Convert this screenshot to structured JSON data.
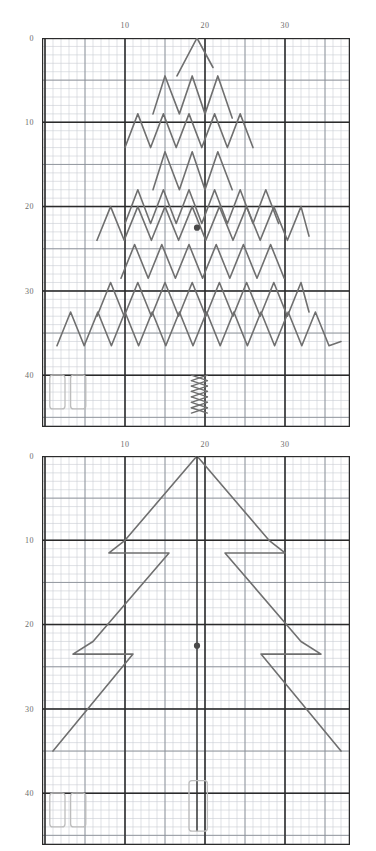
{
  "page": {
    "background_color": "#ffffff",
    "ink_color": "#6f6f6f",
    "grid_minor_color": "#c9cdd4",
    "grid_major_color": "#2b2b2b",
    "marker_color": "#4a4a4a",
    "box_color": "#bdbdbd"
  },
  "charts": [
    {
      "id": "chart-top",
      "name": "chevron-zigzag-chart",
      "axis": {
        "x_ticks": [
          "10",
          "20",
          "30"
        ],
        "x_tick_values": [
          10,
          20,
          30
        ],
        "y_ticks": [
          "0",
          "10",
          "20",
          "30",
          "40"
        ],
        "y_tick_values": [
          0,
          10,
          20,
          30,
          40
        ],
        "xlim": [
          0,
          38
        ],
        "ylim": [
          0,
          45
        ],
        "grid": true,
        "minor_step": 1,
        "major_step": 10
      },
      "marker": {
        "x": 19.0,
        "y": 22.5,
        "label": "center-point"
      }
    },
    {
      "id": "chart-bottom",
      "name": "large-chevron-chart",
      "axis": {
        "x_ticks": [
          "10",
          "20",
          "30"
        ],
        "x_tick_values": [
          10,
          20,
          30
        ],
        "y_ticks": [
          "0",
          "10",
          "20",
          "30",
          "40"
        ],
        "y_tick_values": [
          0,
          10,
          20,
          30,
          40
        ],
        "xlim": [
          0,
          38
        ],
        "ylim": [
          0,
          45
        ],
        "grid": true,
        "minor_step": 1,
        "major_step": 10
      },
      "marker": {
        "x": 19.0,
        "y": 22.5,
        "label": "center-point"
      }
    }
  ],
  "chart_data": [
    {
      "type": "line",
      "title": "Nested chevron zigzag rows (top panel)",
      "xlabel": "",
      "ylabel": "",
      "xlim": [
        0,
        38
      ],
      "ylim": [
        0,
        45
      ],
      "grid": true,
      "legend": "none",
      "x_tick_labels": [
        "10",
        "20",
        "30"
      ],
      "y_tick_labels": [
        "0",
        "10",
        "20",
        "30",
        "40"
      ],
      "series": [
        {
          "name": "row-1-peak",
          "points": [
            [
              16.5,
              4.5
            ],
            [
              19.0,
              0.0
            ],
            [
              21.0,
              3.5
            ]
          ]
        },
        {
          "name": "row-2",
          "points": [
            [
              13.5,
              9.0
            ],
            [
              15.0,
              4.5
            ],
            [
              16.8,
              9.0
            ],
            [
              18.4,
              4.5
            ],
            [
              20.0,
              9.0
            ],
            [
              21.6,
              4.5
            ],
            [
              23.4,
              9.5
            ]
          ]
        },
        {
          "name": "row-3",
          "points": [
            [
              10.0,
              13.0
            ],
            [
              11.6,
              9.0
            ],
            [
              13.2,
              13.0
            ],
            [
              14.8,
              9.0
            ],
            [
              16.4,
              13.0
            ],
            [
              18.0,
              9.0
            ],
            [
              19.6,
              13.0
            ],
            [
              21.2,
              9.0
            ],
            [
              22.8,
              13.0
            ],
            [
              24.4,
              9.0
            ],
            [
              26.0,
              13.0
            ]
          ]
        },
        {
          "name": "row-4",
          "points": [
            [
              13.5,
              18.0
            ],
            [
              15.0,
              13.5
            ],
            [
              16.8,
              18.0
            ],
            [
              18.4,
              13.5
            ],
            [
              20.0,
              18.0
            ],
            [
              21.6,
              13.5
            ],
            [
              23.4,
              18.0
            ]
          ]
        },
        {
          "name": "row-5",
          "points": [
            [
              10.0,
              22.0
            ],
            [
              11.6,
              18.0
            ],
            [
              13.2,
              22.0
            ],
            [
              14.8,
              18.0
            ],
            [
              16.4,
              22.0
            ],
            [
              18.0,
              18.0
            ],
            [
              19.6,
              22.0
            ],
            [
              21.2,
              18.0
            ],
            [
              22.8,
              22.0
            ],
            [
              24.4,
              18.0
            ],
            [
              26.0,
              22.0
            ],
            [
              27.6,
              18.0
            ],
            [
              29.2,
              22.0
            ]
          ]
        },
        {
          "name": "row-6",
          "points": [
            [
              6.5,
              24.0
            ],
            [
              8.2,
              20.0
            ],
            [
              9.9,
              24.0
            ],
            [
              11.6,
              20.0
            ],
            [
              13.3,
              24.0
            ],
            [
              15.0,
              20.0
            ],
            [
              16.7,
              24.0
            ],
            [
              18.4,
              20.0
            ],
            [
              20.1,
              24.0
            ],
            [
              21.8,
              20.0
            ],
            [
              23.5,
              24.0
            ],
            [
              25.2,
              20.0
            ],
            [
              26.9,
              24.0
            ],
            [
              28.6,
              20.0
            ],
            [
              30.3,
              24.0
            ],
            [
              32.0,
              20.0
            ],
            [
              33.0,
              23.5
            ]
          ]
        },
        {
          "name": "row-7",
          "points": [
            [
              9.5,
              28.5
            ],
            [
              11.2,
              24.5
            ],
            [
              12.9,
              28.5
            ],
            [
              14.6,
              24.5
            ],
            [
              16.3,
              28.5
            ],
            [
              18.0,
              24.5
            ],
            [
              19.7,
              28.5
            ],
            [
              21.4,
              24.5
            ],
            [
              23.1,
              28.5
            ],
            [
              24.8,
              24.5
            ],
            [
              26.5,
              28.5
            ],
            [
              28.2,
              24.5
            ],
            [
              29.9,
              28.5
            ]
          ]
        },
        {
          "name": "row-8",
          "points": [
            [
              6.5,
              33.0
            ],
            [
              8.2,
              29.0
            ],
            [
              9.9,
              33.0
            ],
            [
              11.6,
              29.0
            ],
            [
              13.3,
              33.0
            ],
            [
              15.0,
              29.0
            ],
            [
              16.7,
              33.0
            ],
            [
              18.4,
              29.0
            ],
            [
              20.1,
              33.0
            ],
            [
              21.8,
              29.0
            ],
            [
              23.5,
              33.0
            ],
            [
              25.2,
              29.0
            ],
            [
              26.9,
              33.0
            ],
            [
              28.6,
              29.0
            ],
            [
              30.3,
              33.0
            ],
            [
              32.0,
              29.0
            ],
            [
              33.0,
              32.5
            ]
          ]
        },
        {
          "name": "row-9",
          "points": [
            [
              1.5,
              36.5
            ],
            [
              3.2,
              32.5
            ],
            [
              4.9,
              36.5
            ],
            [
              6.6,
              32.5
            ],
            [
              8.3,
              36.5
            ],
            [
              10.0,
              32.5
            ],
            [
              11.7,
              36.5
            ],
            [
              13.4,
              32.5
            ],
            [
              15.1,
              36.5
            ],
            [
              16.8,
              32.5
            ],
            [
              18.5,
              36.5
            ],
            [
              20.2,
              32.5
            ],
            [
              21.9,
              36.5
            ],
            [
              23.6,
              32.5
            ],
            [
              25.3,
              36.5
            ],
            [
              27.0,
              32.5
            ],
            [
              28.7,
              36.5
            ],
            [
              30.4,
              32.5
            ],
            [
              32.1,
              36.5
            ],
            [
              33.8,
              32.5
            ],
            [
              35.5,
              36.5
            ],
            [
              37.0,
              36.0
            ]
          ]
        },
        {
          "name": "center-x-column",
          "points": [
            [
              18.3,
              40.0
            ],
            [
              20.3,
              44.5
            ]
          ],
          "style": "x-stack"
        }
      ],
      "annotations": [
        {
          "type": "point",
          "x": 19.0,
          "y": 22.5,
          "label": "center-marker"
        },
        {
          "type": "rect",
          "x": 0.6,
          "y": 40.0,
          "w": 1.9,
          "h": 4.0,
          "label": "legend-box-1"
        },
        {
          "type": "rect",
          "x": 3.2,
          "y": 40.0,
          "w": 1.9,
          "h": 4.0,
          "label": "legend-box-2"
        }
      ]
    },
    {
      "type": "line",
      "title": "Large chevron with offset steps (bottom panel)",
      "xlabel": "",
      "ylabel": "",
      "xlim": [
        0,
        38
      ],
      "ylim": [
        0,
        45
      ],
      "grid": true,
      "legend": "none",
      "x_tick_labels": [
        "10",
        "20",
        "30"
      ],
      "y_tick_labels": [
        "0",
        "10",
        "20",
        "30",
        "40"
      ],
      "series": [
        {
          "name": "left-zigzag",
          "points": [
            [
              10.0,
              10.0
            ],
            [
              19.0,
              0.0
            ],
            [
              10.0,
              10.0
            ],
            [
              8.0,
              11.5
            ],
            [
              15.5,
              11.5
            ],
            [
              6.0,
              22.0
            ],
            [
              3.5,
              23.5
            ],
            [
              11.0,
              23.5
            ],
            [
              1.0,
              35.0
            ]
          ]
        },
        {
          "name": "right-zigzag",
          "points": [
            [
              28.0,
              10.0
            ],
            [
              19.0,
              0.0
            ],
            [
              28.0,
              10.0
            ],
            [
              30.0,
              11.5
            ],
            [
              22.5,
              11.5
            ],
            [
              32.0,
              22.0
            ],
            [
              34.5,
              23.5
            ],
            [
              27.0,
              23.5
            ],
            [
              37.0,
              35.0
            ]
          ]
        },
        {
          "name": "trunk",
          "points": [
            [
              19.0,
              0.0
            ],
            [
              19.0,
              44.5
            ]
          ],
          "style": "vertical-stem"
        }
      ],
      "annotations": [
        {
          "type": "point",
          "x": 19.0,
          "y": 22.5,
          "label": "center-marker"
        },
        {
          "type": "rect",
          "x": 0.6,
          "y": 40.0,
          "w": 1.9,
          "h": 4.0,
          "label": "legend-box-1"
        },
        {
          "type": "rect",
          "x": 3.2,
          "y": 40.0,
          "w": 1.9,
          "h": 4.0,
          "label": "legend-box-2"
        },
        {
          "type": "rect",
          "x": 18.0,
          "y": 38.5,
          "w": 2.3,
          "h": 6.0,
          "label": "trunk-box"
        }
      ]
    }
  ]
}
